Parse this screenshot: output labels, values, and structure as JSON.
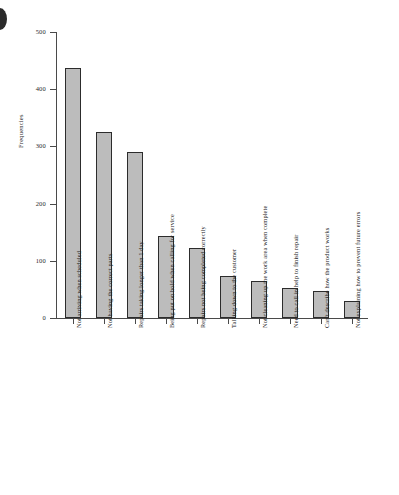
{
  "chart_data": {
    "type": "bar",
    "title": "",
    "subtitle": "",
    "xlabel": "",
    "ylabel": "Frequencies",
    "ylim": [
      0,
      500
    ],
    "yticks": [
      0,
      100,
      200,
      300,
      400,
      500
    ],
    "grid": false,
    "legend": null,
    "orientation": "vertical",
    "bar_color": "#bcbcbc",
    "bar_edge_color": "#2c2c2c",
    "categories": [
      "Not arriving when scheduled",
      "Not having the correct parts",
      "Repairs taking longer than 1 day",
      "Being put on hold when calling for service",
      "Repairs not being completed correctly",
      "Talking down to the customer",
      "Not cleaning up the work area when complete",
      "Need to call in help to finish repair",
      "Can't describe how the product works",
      "Not explaining how to prevent future errors"
    ],
    "values": [
      437,
      325,
      290,
      143,
      122,
      73,
      65,
      53,
      47,
      30
    ]
  },
  "figure": {
    "corner_mark": "page-corner-mark"
  }
}
